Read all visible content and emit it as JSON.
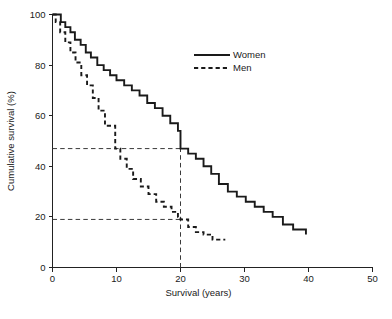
{
  "chart_data": {
    "type": "line",
    "title": "",
    "xlabel": "Survival (years)",
    "ylabel": "Cumulative survival (%)",
    "xlim": [
      0,
      50
    ],
    "ylim": [
      0,
      100
    ],
    "xticks": [
      0,
      10,
      20,
      30,
      40,
      50
    ],
    "xticklabels": [
      "0",
      "10",
      "20",
      "30",
      "40",
      "50"
    ],
    "yticks": [
      0,
      20,
      40,
      60,
      80,
      100
    ],
    "yticklabels": [
      "0",
      "20",
      "40",
      "60",
      "80",
      "100"
    ],
    "grid": false,
    "legend_position": "upper-right",
    "step_style": "post",
    "series": [
      {
        "name": "Women",
        "style": "solid",
        "x": [
          0,
          0.6,
          1.3,
          2.0,
          2.8,
          3.5,
          4.4,
          5.2,
          6.0,
          7.0,
          8.0,
          9.0,
          10.0,
          11.2,
          12.4,
          13.6,
          14.8,
          16.0,
          17.2,
          18.4,
          19.6,
          20.0,
          21.2,
          22.4,
          23.6,
          24.8,
          26.0,
          27.4,
          28.8,
          30.2,
          31.6,
          33.0,
          34.4,
          36.0,
          37.6,
          39.6
        ],
        "y": [
          100,
          100,
          97,
          95,
          93,
          90,
          88,
          85,
          83,
          80,
          78,
          76,
          74,
          72,
          70,
          68,
          65,
          63,
          60,
          57,
          54,
          47,
          45,
          43,
          40,
          37,
          33,
          30,
          28,
          26,
          24,
          22,
          20,
          17,
          15,
          13
        ]
      },
      {
        "name": "Men",
        "style": "dashed",
        "x": [
          0,
          0.5,
          1.2,
          2.0,
          2.8,
          3.6,
          4.5,
          5.4,
          6.3,
          7.2,
          8.2,
          9.2,
          9.8,
          10.6,
          11.6,
          12.6,
          13.8,
          15.0,
          16.2,
          17.4,
          18.6,
          19.6,
          20.0,
          21.2,
          22.4,
          23.6,
          25.0,
          27.0
        ],
        "y": [
          100,
          97,
          93,
          89,
          85,
          81,
          76,
          72,
          67,
          62,
          56,
          56,
          47,
          43,
          39,
          35,
          32,
          29,
          26,
          24,
          22,
          20,
          19,
          16,
          14,
          13,
          11,
          11
        ]
      }
    ],
    "reference_lines": [
      {
        "name": "women-median-marker",
        "orientation": "horizontal",
        "y": 47,
        "x_from": 0,
        "x_to": 20
      },
      {
        "name": "men-20yr-marker",
        "orientation": "horizontal",
        "y": 19,
        "x_from": 0,
        "x_to": 20
      },
      {
        "name": "twenty-year-marker",
        "orientation": "vertical",
        "x": 20,
        "y_from": 0,
        "y_to": 47
      }
    ],
    "annotations": []
  },
  "legend": {
    "entries": [
      {
        "label": "Women",
        "style": "solid"
      },
      {
        "label": "Men",
        "style": "dashed"
      }
    ]
  }
}
